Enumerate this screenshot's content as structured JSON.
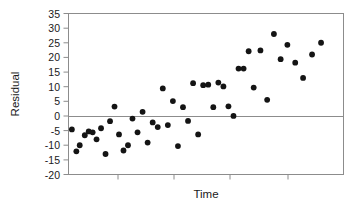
{
  "chart_data": {
    "type": "scatter",
    "title": "",
    "xlabel": "Time",
    "ylabel": "Residual",
    "ylim": [
      -20,
      35
    ],
    "ytick_labels": [
      "35",
      "30",
      "25",
      "20",
      "15",
      "10",
      "5",
      "0",
      "-5",
      "-10",
      "-15",
      "-20"
    ],
    "yticks": [
      35,
      30,
      25,
      20,
      15,
      10,
      5,
      0,
      -5,
      -10,
      -15,
      -20
    ],
    "xlim": [
      0,
      49
    ],
    "xtick_labels": [
      "",
      "",
      "",
      ""
    ],
    "xticks": [
      9,
      19,
      29,
      39
    ],
    "grid": false,
    "legend": null,
    "reference_line_y": 0,
    "marker": "filled-circle",
    "marker_color": "#141414",
    "frame_color": "#8c8c8c",
    "n_points": 48,
    "x": [
      0.6,
      1.4,
      2.0,
      2.9,
      3.6,
      4.3,
      5.0,
      5.8,
      6.6,
      7.4,
      8.2,
      9.0,
      9.8,
      10.6,
      11.4,
      12.3,
      13.2,
      14.1,
      15.0,
      15.9,
      16.8,
      17.7,
      18.6,
      19.5,
      20.4,
      21.3,
      22.2,
      23.1,
      24.0,
      24.9,
      25.8,
      26.7,
      27.6,
      28.5,
      29.4,
      30.3,
      31.2,
      32.1,
      33.0,
      34.2,
      35.4,
      36.6,
      37.8,
      39.0,
      40.4,
      41.8,
      43.4,
      45.0
    ],
    "y": [
      -4.6,
      -12.1,
      -10.0,
      -6.6,
      -5.3,
      -5.6,
      -8.0,
      -4.2,
      -13.0,
      -1.8,
      3.2,
      -6.3,
      -11.8,
      -10.0,
      -0.9,
      -5.6,
      1.4,
      -9.1,
      -2.2,
      -3.8,
      9.4,
      -3.1,
      5.1,
      -10.3,
      3.0,
      -1.7,
      11.2,
      -6.3,
      10.5,
      10.7,
      3.0,
      11.4,
      10.1,
      3.3,
      0.0,
      16.2,
      16.2,
      22.1,
      9.7,
      22.4,
      5.5,
      28.0,
      19.4,
      24.3,
      18.2,
      13.0,
      21.0,
      25.0
    ],
    "series_note": "Residuals increase with Time, indicating positive trend in residuals"
  },
  "axes": {
    "y_label": "Residual",
    "x_label": "Time"
  }
}
